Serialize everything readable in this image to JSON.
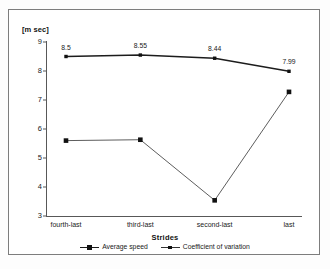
{
  "chart_data": {
    "type": "line",
    "title": "",
    "xlabel": "Strides",
    "ylabel": "[m sec]",
    "categories": [
      "fourth-last",
      "third-last",
      "second-last",
      "last"
    ],
    "ylim": [
      3,
      9
    ],
    "y_ticks": [
      "3",
      "4",
      "5",
      "6",
      "7",
      "8",
      "9"
    ],
    "grid": false,
    "legend_position": "bottom",
    "series": [
      {
        "name": "Average speed",
        "values": [
          8.5,
          8.55,
          8.44,
          7.99
        ],
        "labels": [
          "8.5",
          "8.55",
          "8.44",
          "7.99"
        ],
        "color": "#1c1c1c",
        "marker": "square",
        "line_width": "thick"
      },
      {
        "name": "Coefficient of variation",
        "values": [
          5.6,
          5.63,
          3.54,
          7.28
        ],
        "labels": [
          "",
          "",
          "",
          ""
        ],
        "color": "#333333",
        "marker": "square",
        "line_width": "thin"
      }
    ]
  },
  "axis": {
    "y_title": "[m sec]",
    "x_title": "Strides"
  },
  "legend": {
    "entries": [
      {
        "label": "Average speed"
      },
      {
        "label": "Coefficient of variation"
      }
    ]
  }
}
